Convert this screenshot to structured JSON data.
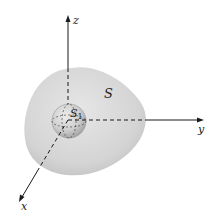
{
  "figure": {
    "axes": {
      "x_label": "x",
      "y_label": "y",
      "z_label": "z"
    },
    "surfaces": {
      "outer_label": "S",
      "inner_label": "S",
      "inner_subscript": "1"
    },
    "colors": {
      "background": "#ffffff",
      "outer_fill": "#d9d9d9",
      "outer_shade": "#c4c4c4",
      "inner_fill": "#cfcfcf",
      "line": "#1a1a1a"
    }
  }
}
